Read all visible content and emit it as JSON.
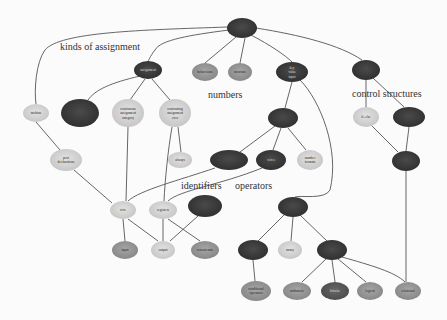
{
  "diagram": {
    "type": "concept-map",
    "colors": {
      "dark": "#3a3a3a",
      "mid": "#8e8e8e",
      "light": "#cfcfcf",
      "edge": "#555555",
      "background": "#fbfbfb"
    },
    "section_labels": [
      {
        "id": "kinds",
        "text": "kinds of assignment",
        "x": 60,
        "y": 50,
        "size": 10
      },
      {
        "id": "numbers",
        "text": "numbers",
        "x": 208,
        "y": 98,
        "size": 10
      },
      {
        "id": "control",
        "text": "control structures",
        "x": 352,
        "y": 97,
        "size": 10
      },
      {
        "id": "identifiers",
        "text": "identifiers",
        "x": 181,
        "y": 189,
        "size": 10
      },
      {
        "id": "operators",
        "text": "operators",
        "x": 235,
        "y": 189,
        "size": 10
      }
    ],
    "nodes": [
      {
        "id": "root",
        "label": "",
        "x": 242,
        "y": 28,
        "rx": 15,
        "ry": 10,
        "tone": "dark"
      },
      {
        "id": "assignment",
        "label": "assignment",
        "x": 148,
        "y": 70,
        "rx": 14,
        "ry": 9,
        "tone": "dark"
      },
      {
        "id": "behaviours",
        "label": "behaviours",
        "x": 205,
        "y": 72,
        "rx": 13,
        "ry": 9,
        "tone": "mid"
      },
      {
        "id": "structure",
        "label": "structure",
        "x": 240,
        "y": 72,
        "rx": 12,
        "ry": 9,
        "tone": "mid"
      },
      {
        "id": "key_value",
        "label": "key value input",
        "x": 292,
        "y": 72,
        "rx": 16,
        "ry": 10,
        "tone": "dark"
      },
      {
        "id": "cs_node",
        "label": "",
        "x": 366,
        "y": 70,
        "rx": 14,
        "ry": 10,
        "tone": "dark"
      },
      {
        "id": "mobius",
        "label": "mobius",
        "x": 36,
        "y": 113,
        "rx": 13,
        "ry": 9,
        "tone": "light"
      },
      {
        "id": "dark_left",
        "label": "",
        "x": 80,
        "y": 113,
        "rx": 19,
        "ry": 14,
        "tone": "dark"
      },
      {
        "id": "continuous",
        "label": "continuous assignment category",
        "x": 128,
        "y": 113,
        "rx": 16,
        "ry": 14,
        "tone": "light"
      },
      {
        "id": "contrasting",
        "label": "contrasting assignment over",
        "x": 175,
        "y": 113,
        "rx": 16,
        "ry": 14,
        "tone": "light"
      },
      {
        "id": "dark_mid",
        "label": "",
        "x": 283,
        "y": 118,
        "rx": 15,
        "ry": 10,
        "tone": "dark"
      },
      {
        "id": "if_else",
        "label": "if..else",
        "x": 366,
        "y": 117,
        "rx": 13,
        "ry": 10,
        "tone": "light"
      },
      {
        "id": "cs_dark2",
        "label": "",
        "x": 409,
        "y": 117,
        "rx": 16,
        "ry": 10,
        "tone": "dark"
      },
      {
        "id": "post_decl",
        "label": "post declarations",
        "x": 66,
        "y": 160,
        "rx": 16,
        "ry": 11,
        "tone": "light"
      },
      {
        "id": "always",
        "label": "always",
        "x": 180,
        "y": 160,
        "rx": 12,
        "ry": 8,
        "tone": "light"
      },
      {
        "id": "dark_ident",
        "label": "",
        "x": 229,
        "y": 160,
        "rx": 19,
        "ry": 10,
        "tone": "dark"
      },
      {
        "id": "wire_op",
        "label": "wires",
        "x": 271,
        "y": 160,
        "rx": 15,
        "ry": 10,
        "tone": "dark"
      },
      {
        "id": "number_format",
        "label": "number formats",
        "x": 310,
        "y": 160,
        "rx": 13,
        "ry": 10,
        "tone": "light"
      },
      {
        "id": "cs_dark3",
        "label": "",
        "x": 406,
        "y": 161,
        "rx": 14,
        "ry": 10,
        "tone": "dark"
      },
      {
        "id": "wire",
        "label": "wire",
        "x": 123,
        "y": 210,
        "rx": 13,
        "ry": 9,
        "tone": "light"
      },
      {
        "id": "register",
        "label": "registers",
        "x": 163,
        "y": 210,
        "rx": 14,
        "ry": 9,
        "tone": "light"
      },
      {
        "id": "dark_op",
        "label": "",
        "x": 205,
        "y": 206,
        "rx": 17,
        "ry": 11,
        "tone": "dark"
      },
      {
        "id": "dark_ops2",
        "label": "",
        "x": 293,
        "y": 207,
        "rx": 15,
        "ry": 10,
        "tone": "dark"
      },
      {
        "id": "input",
        "label": "input",
        "x": 125,
        "y": 250,
        "rx": 13,
        "ry": 9,
        "tone": "mid"
      },
      {
        "id": "output",
        "label": "output",
        "x": 163,
        "y": 250,
        "rx": 12,
        "ry": 9,
        "tone": "light"
      },
      {
        "id": "concatenate",
        "label": "concatenate",
        "x": 205,
        "y": 250,
        "rx": 14,
        "ry": 9,
        "tone": "mid"
      },
      {
        "id": "dark_cond",
        "label": "",
        "x": 253,
        "y": 250,
        "rx": 15,
        "ry": 10,
        "tone": "dark"
      },
      {
        "id": "unary",
        "label": "unary",
        "x": 290,
        "y": 250,
        "rx": 12,
        "ry": 9,
        "tone": "light"
      },
      {
        "id": "dark_binary",
        "label": "",
        "x": 332,
        "y": 250,
        "rx": 15,
        "ry": 10,
        "tone": "dark"
      },
      {
        "id": "conditional_op",
        "label": "conditional operators",
        "x": 256,
        "y": 291,
        "rx": 15,
        "ry": 10,
        "tone": "mid"
      },
      {
        "id": "arithmetic",
        "label": "arithmetic",
        "x": 297,
        "y": 291,
        "rx": 14,
        "ry": 9,
        "tone": "mid"
      },
      {
        "id": "bitwise",
        "label": "bitwise",
        "x": 335,
        "y": 291,
        "rx": 14,
        "ry": 9,
        "tone": "dark2"
      },
      {
        "id": "logical",
        "label": "logical",
        "x": 370,
        "y": 291,
        "rx": 13,
        "ry": 9,
        "tone": "mid"
      },
      {
        "id": "relational",
        "label": "relational",
        "x": 408,
        "y": 291,
        "rx": 13,
        "ry": 9,
        "tone": "mid"
      }
    ],
    "edges": [
      {
        "d": "M228,27 C140,30 60,32 45,50 C36,62 34,90 36,104"
      },
      {
        "d": "M229,30 C190,35 160,40 155,50 C150,56 148,62 148,62"
      },
      {
        "d": "M236,37 L205,63"
      },
      {
        "d": "M245,38 L240,63"
      },
      {
        "d": "M251,35 C270,45 285,55 292,62"
      },
      {
        "d": "M256,28 C300,35 340,45 362,60"
      },
      {
        "d": "M140,76 C110,83 95,90 88,100"
      },
      {
        "d": "M145,79 L130,100"
      },
      {
        "d": "M152,79 L170,100"
      },
      {
        "d": "M36,122 L60,150"
      },
      {
        "d": "M74,170 L112,203"
      },
      {
        "d": "M128,127 L126,201"
      },
      {
        "d": "M172,127 C168,150 165,180 164,201"
      },
      {
        "d": "M178,127 L181,152"
      },
      {
        "d": "M292,82 L285,108"
      },
      {
        "d": "M275,126 L240,152"
      },
      {
        "d": "M281,128 L273,150"
      },
      {
        "d": "M288,128 L306,150"
      },
      {
        "d": "M366,80 L366,107"
      },
      {
        "d": "M373,78 L404,107"
      },
      {
        "d": "M371,125 L398,152"
      },
      {
        "d": "M409,127 L406,151"
      },
      {
        "d": "M406,171 L406,282"
      },
      {
        "d": "M215,168 C180,180 140,190 128,201"
      },
      {
        "d": "M262,168 C220,185 180,190 168,201"
      },
      {
        "d": "M300,80 C320,100 340,150 330,190 C325,200 300,195 295,197"
      },
      {
        "d": "M123,219 L125,241"
      },
      {
        "d": "M128,219 L158,241"
      },
      {
        "d": "M163,219 L163,241"
      },
      {
        "d": "M168,219 L200,241"
      },
      {
        "d": "M198,216 L170,241"
      },
      {
        "d": "M285,214 L258,241"
      },
      {
        "d": "M293,217 L291,241"
      },
      {
        "d": "M300,215 L327,241"
      },
      {
        "d": "M253,260 L255,281"
      },
      {
        "d": "M326,259 L302,282"
      },
      {
        "d": "M332,260 L335,282"
      },
      {
        "d": "M338,259 L366,282"
      },
      {
        "d": "M342,257 C370,265 395,272 405,282"
      }
    ]
  }
}
